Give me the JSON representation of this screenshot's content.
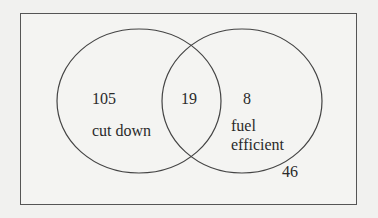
{
  "diagram": {
    "type": "venn",
    "sets": [
      {
        "label": "cut down",
        "only_count": "105"
      },
      {
        "label": "fuel efficient",
        "only_count": "8"
      }
    ],
    "intersection_count": "19",
    "outside_count": "46",
    "labels": {
      "left_count": "105",
      "left_name": "cut down",
      "middle_count": "19",
      "right_count": "8",
      "right_name_line1": "fuel",
      "right_name_line2": "efficient",
      "outside_count": "46"
    },
    "colors": {
      "stroke": "#444444",
      "background": "#f4f4f2"
    }
  }
}
